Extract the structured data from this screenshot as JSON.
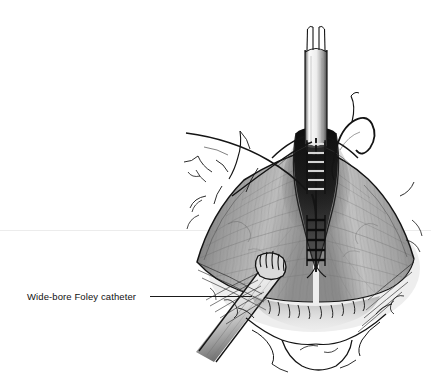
{
  "figure": {
    "kind": "medical-surgical-illustration",
    "medium": "pen-and-ink with graphite wash",
    "background_color": "#ffffff",
    "canvas": {
      "width": 431,
      "height": 387
    }
  },
  "annotations": [
    {
      "id": "foley-catheter",
      "label": "Wide-bore Foley catheter",
      "text_color": "#111111",
      "text_x": 27,
      "text_y": 300,
      "leader_from_x": 150,
      "leader_from_y": 296,
      "leader_to_x": 252,
      "leader_to_y": 296
    }
  ],
  "rule": {
    "name": "page-hairline",
    "color": "#ececec",
    "y": 230,
    "x_start": 0,
    "x_end": 431
  },
  "structures": [
    {
      "name": "bifurcated-catheter-shaft",
      "region": "top-center",
      "x": 303,
      "y": 28,
      "w": 24,
      "h": 120,
      "tone": "#f2f2f2"
    },
    {
      "name": "interrupted-suture-ladder",
      "region": "center-vertical",
      "x": 310,
      "y": 138,
      "w": 16,
      "h": 128,
      "tone": "#101010"
    },
    {
      "name": "retracted-tissue-flaps",
      "region": "center",
      "tone": "#8d8d8d"
    },
    {
      "name": "dark-apex-shadow",
      "region": "upper-center",
      "tone": "#151515"
    },
    {
      "name": "foley-catheter-tube",
      "region": "lower-left",
      "tone": "#e8e8e8"
    },
    {
      "name": "catheter-ribbed-tip",
      "region": "lower-center-left",
      "tone": "#2b2b2b"
    },
    {
      "name": "curved-suture-thread-right",
      "region": "upper-right",
      "tone": "#111111"
    },
    {
      "name": "crossing-suture-threads-left",
      "region": "upper-left",
      "tone": "#111111"
    },
    {
      "name": "skin-fold-line-art",
      "region": "bottom",
      "tone": "#1a1a1a"
    }
  ],
  "palette": {
    "ink": "#141414",
    "ink_soft": "#3a3a3a",
    "tissue_mid": "#8d8d8d",
    "tissue_light": "#c9c9c9",
    "tissue_dark": "#3d3d3d",
    "shadow_deep": "#101010",
    "highlight": "#f4f4f4",
    "paper": "#ffffff",
    "rule_gray": "#ececec"
  }
}
